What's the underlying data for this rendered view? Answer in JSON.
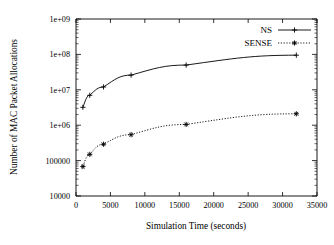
{
  "chart_data": {
    "type": "line",
    "title": "",
    "xlabel": "Simulation Time (seconds)",
    "ylabel": "Number of MAC Packet Allocations",
    "xlim": [
      0,
      35000
    ],
    "ylim": [
      10000,
      1000000000
    ],
    "yscale": "log",
    "xscale": "linear",
    "grid": false,
    "legend_position": "top-right",
    "xticks": [
      "0",
      "5000",
      "10000",
      "15000",
      "20000",
      "25000",
      "30000",
      "35000"
    ],
    "xtick_values": [
      0,
      5000,
      10000,
      15000,
      20000,
      25000,
      30000,
      35000
    ],
    "yticks": [
      "10000",
      "100000",
      "1e+06",
      "1e+07",
      "1e+08",
      "1e+09"
    ],
    "ytick_values": [
      10000,
      100000,
      1000000,
      10000000,
      100000000,
      1000000000
    ],
    "x": [
      1000,
      2000,
      4000,
      8000,
      16000,
      32000
    ],
    "series": [
      {
        "name": "NS",
        "values": [
          3200000,
          7000000,
          12000000,
          26000000,
          50000000,
          95000000
        ],
        "linestyle": "solid",
        "marker": "plus",
        "color": "#000000"
      },
      {
        "name": "SENSE",
        "values": [
          68000,
          150000,
          290000,
          540000,
          1050000,
          2100000
        ],
        "linestyle": "dotted",
        "marker": "star",
        "color": "#000000"
      }
    ]
  },
  "legend": {
    "entries": [
      {
        "label": "NS"
      },
      {
        "label": "SENSE"
      }
    ]
  },
  "axes": {
    "x_label": "Simulation Time (seconds)",
    "y_label": "Number of MAC Packet Allocations"
  }
}
